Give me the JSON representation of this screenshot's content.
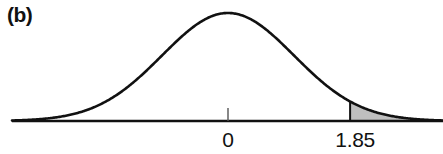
{
  "panel": {
    "label": "(b)"
  },
  "chart_data": {
    "type": "line",
    "title": "",
    "subtitle": "",
    "xlabel": "",
    "ylabel": "",
    "distribution": {
      "name": "standard normal",
      "mean": 0,
      "sd": 1
    },
    "x": [
      -3.3,
      -3.0,
      -2.75,
      -2.5,
      -2.25,
      -2.0,
      -1.75,
      -1.5,
      -1.25,
      -1.0,
      -0.75,
      -0.5,
      -0.25,
      0,
      0.25,
      0.5,
      0.75,
      1.0,
      1.25,
      1.5,
      1.75,
      1.85,
      2.0,
      2.25,
      2.5,
      2.75,
      3.0,
      3.25
    ],
    "y": [
      0.0017,
      0.0044,
      0.0091,
      0.0175,
      0.0317,
      0.054,
      0.0863,
      0.1295,
      0.1826,
      0.242,
      0.3011,
      0.3521,
      0.3867,
      0.3989,
      0.3867,
      0.3521,
      0.3011,
      0.242,
      0.1826,
      0.1295,
      0.0863,
      0.0721,
      0.054,
      0.0317,
      0.0175,
      0.0091,
      0.0044,
      0.002
    ],
    "xlim": [
      -3.3,
      3.25
    ],
    "ylim": [
      0,
      0.42
    ],
    "grid": false,
    "legend": false,
    "axis_ticks": [
      {
        "value": 0,
        "label": "0",
        "has_tick_mark": true
      },
      {
        "value": 1.85,
        "label": "1.85",
        "has_tick_mark": false
      }
    ],
    "shaded_region": {
      "label": "upper tail",
      "from": 1.85,
      "to": 3.25,
      "boundary_line_at": 1.85,
      "fill_color": "#bfbfbf",
      "area": 0.0322
    },
    "colors": {
      "curve": "#111111",
      "axis": "#111111",
      "shade": "#bfbfbf",
      "background": "#ffffff"
    }
  }
}
